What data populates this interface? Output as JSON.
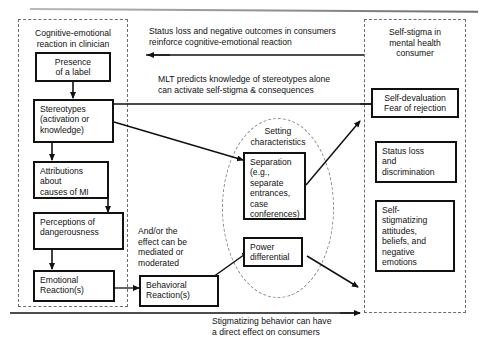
{
  "figure": {
    "type": "flow-diagram",
    "background": "#ffffff",
    "stroke_color": "#111111",
    "dashed_color": "#6d6d6d"
  },
  "regions": [
    {
      "id": "clinician",
      "title": "Cognitive-emotional\nreaction in clinician"
    },
    {
      "id": "consumer",
      "title": "Self-stigma in\nmental health\nconsumer"
    },
    {
      "id": "setting",
      "title": "Setting\ncharacteristics"
    }
  ],
  "nodes": {
    "presence_of_label": "Presence\nof a label",
    "stereotypes": "Stereotypes\n(activation or\nknowledge)",
    "attributions": "Attributions\nabout\ncauses of MI",
    "perceptions": "Perceptions of\ndangerousness",
    "emotional_reactions": "Emotional\nReaction(s)",
    "behavioral_reactions": "Behavioral\nReaction(s)",
    "separation": "Separation\n(e.g.,\nseparate\nentrances,\ncase\nconferences)",
    "power_differential": "Power\ndifferential",
    "self_devaluation": "Self-devaluation\nFear of rejection",
    "status_loss": "Status loss\nand\ndiscrimination",
    "self_stigmatizing": "Self-\nstigmatizing\nattitudes,\nbeliefs, and\nnegative\nemotions"
  },
  "annotations": {
    "feedback_top": "Status loss and negative outcomes in consumers\nreinforce cognitive-emotional reaction",
    "mlt": "MLT predicts knowledge of stereotypes alone\ncan activate self-stigma & consequences",
    "mediation": "And/or the\neffect can be\nmediated or\nmoderated",
    "direct_effect": "Stigmatizing behavior can have\na direct effect on consumers"
  }
}
